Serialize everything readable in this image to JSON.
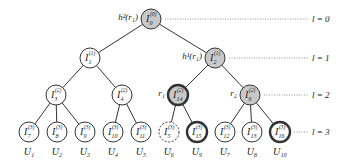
{
  "diagram": {
    "title": "",
    "levels": [
      {
        "label": "l = 0",
        "y": 19
      },
      {
        "label": "l = 1",
        "y": 58
      },
      {
        "label": "l = 2",
        "y": 95
      },
      {
        "label": "l = 3",
        "y": 132
      }
    ],
    "colors": {
      "gray_fill": "#c8c8c8",
      "white_fill": "#ffffff",
      "stroke": "#333333",
      "dotted_line": "#777777"
    },
    "nodes": [
      {
        "id": "I0",
        "base": "I",
        "sub": "0",
        "sup": "(0)",
        "x": 151,
        "y": 19,
        "style": "gray",
        "side_label": "h²(r₁)"
      },
      {
        "id": "I1",
        "base": "I",
        "sub": "1",
        "sup": "(1)",
        "x": 90,
        "y": 58,
        "style": "plain"
      },
      {
        "id": "I2",
        "base": "I",
        "sub": "2",
        "sup": "(1)",
        "x": 215,
        "y": 58,
        "style": "gray",
        "side_label": "h¹(r₁)"
      },
      {
        "id": "I3",
        "base": "I",
        "sub": "3",
        "sup": "(2)",
        "x": 56,
        "y": 95,
        "style": "plain"
      },
      {
        "id": "I4",
        "base": "I",
        "sub": "4",
        "sup": "(2)",
        "x": 122,
        "y": 95,
        "style": "plain"
      },
      {
        "id": "I14",
        "base": "I",
        "sub": "14",
        "sup": "(2)",
        "x": 178,
        "y": 95,
        "style": "gray-thick",
        "side_label": "r₁"
      },
      {
        "id": "I6",
        "base": "I",
        "sub": "6",
        "sup": "(2)",
        "x": 250,
        "y": 95,
        "style": "gray",
        "side_label": "r₂"
      },
      {
        "id": "I7",
        "base": "I",
        "sub": "7",
        "sup": "(3)",
        "x": 29,
        "y": 132,
        "style": "plain",
        "user": "U₁"
      },
      {
        "id": "I8",
        "base": "I",
        "sub": "8",
        "sup": "(3)",
        "x": 57,
        "y": 132,
        "style": "plain",
        "user": "U₂"
      },
      {
        "id": "I9",
        "base": "I",
        "sub": "9",
        "sup": "(3)",
        "x": 85,
        "y": 132,
        "style": "plain",
        "user": "U₃"
      },
      {
        "id": "I10",
        "base": "I",
        "sub": "10",
        "sup": "(3)",
        "x": 113,
        "y": 132,
        "style": "plain",
        "user": "U₄"
      },
      {
        "id": "I11",
        "base": "I",
        "sub": "11",
        "sup": "(3)",
        "x": 141,
        "y": 132,
        "style": "plain",
        "user": "U₅"
      },
      {
        "id": "I5",
        "base": "I",
        "sub": "5",
        "sup": "(3)",
        "x": 169,
        "y": 132,
        "style": "dashed",
        "user": "U₆"
      },
      {
        "id": "I15",
        "base": "I",
        "sub": "15",
        "sup": "(3)",
        "x": 197,
        "y": 132,
        "style": "thick",
        "user": "U₉"
      },
      {
        "id": "I12",
        "base": "I",
        "sub": "12",
        "sup": "(3)",
        "x": 225,
        "y": 132,
        "style": "plain",
        "user": "U₇"
      },
      {
        "id": "I13",
        "base": "I",
        "sub": "13",
        "sup": "(3)",
        "x": 252,
        "y": 132,
        "style": "plain",
        "user": "U₈"
      },
      {
        "id": "I16",
        "base": "I",
        "sub": "16",
        "sup": "(3)",
        "x": 280,
        "y": 132,
        "style": "thick",
        "user": "U₁₀"
      }
    ],
    "edges": [
      [
        "I0",
        "I1"
      ],
      [
        "I0",
        "I2"
      ],
      [
        "I1",
        "I3"
      ],
      [
        "I1",
        "I4"
      ],
      [
        "I2",
        "I14"
      ],
      [
        "I2",
        "I6"
      ],
      [
        "I3",
        "I7"
      ],
      [
        "I3",
        "I8"
      ],
      [
        "I3",
        "I9"
      ],
      [
        "I4",
        "I10"
      ],
      [
        "I4",
        "I11"
      ],
      [
        "I14",
        "I5"
      ],
      [
        "I14",
        "I15"
      ],
      [
        "I6",
        "I12"
      ],
      [
        "I6",
        "I13"
      ],
      [
        "I6",
        "I16"
      ]
    ]
  }
}
